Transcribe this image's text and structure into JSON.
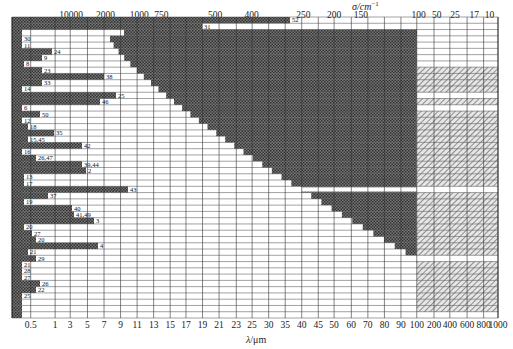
{
  "chart_data": {
    "type": "bar",
    "subtype": "horizontal-range-bars (infrared transmission ranges of materials)",
    "title": "",
    "top_axis": {
      "label": "σ/cm⁻¹",
      "ticks": [
        "10000",
        "2000",
        "1000",
        "750",
        "500",
        "400",
        "250",
        "200",
        "150",
        "100",
        "50",
        "25",
        "17",
        "10"
      ]
    },
    "bottom_axis": {
      "label": "λ/μm",
      "ticks": [
        "0.5",
        "1",
        "3",
        "5",
        "7",
        "9",
        "11",
        "13",
        "15",
        "17",
        "19",
        "21",
        "23",
        "25",
        "30",
        "35",
        "40",
        "45",
        "50",
        "60",
        "70",
        "80",
        "90",
        "100",
        "200",
        "400",
        "600",
        "800",
        "1000"
      ]
    },
    "grid": true,
    "legend": "none",
    "series": [
      {
        "label": "52",
        "start": 0.5,
        "end": "~33 μm (col 17.3)"
      },
      {
        "label": "31",
        "start": 0.5,
        "end": "~19 μm (col 9)"
      },
      {
        "label": "",
        "start": 0.5,
        "end": "~1.5 μm"
      },
      {
        "label": "30",
        "start": 0.5,
        "end": "~0.7 μm"
      },
      {
        "label": "11",
        "start": 0.5,
        "end": "~0.55 μm"
      },
      {
        "label": "24",
        "start": 0.5,
        "end": "~1 μm"
      },
      {
        "label": "9",
        "start": 0.5,
        "end": "~2 μm"
      },
      {
        "label": "8",
        "start": 0.5,
        "end": "~1.2 μm"
      },
      {
        "label": "23",
        "start": 0.5,
        "end": "~1 μm"
      },
      {
        "label": "38",
        "start": 0.5,
        "end": "~9 μm"
      },
      {
        "label": "33",
        "start": 0.5,
        "end": "~1.5 μm"
      },
      {
        "label": "14",
        "start": 0.5,
        "end": "~0.6 μm"
      },
      {
        "label": "25",
        "start": 0.5,
        "end": "~9 μm"
      },
      {
        "label": "46",
        "start": 0.5,
        "end": "~6 μm"
      },
      {
        "label": "6",
        "start": 0.5,
        "end": "~0.6 μm"
      },
      {
        "label": "50",
        "start": 0.5,
        "end": "~1 μm"
      },
      {
        "label": "12",
        "start": 0.5,
        "end": "~0.6 μm"
      },
      {
        "label": "18",
        "start": 0.5,
        "end": "~0.8 μm"
      },
      {
        "label": "35",
        "start": 0.5,
        "end": "~1.6 μm"
      },
      {
        "label": "15,45",
        "start": 0.5,
        "end": "~0.7 μm"
      },
      {
        "label": "42",
        "start": 0.5,
        "end": "~6 μm"
      },
      {
        "label": "16",
        "start": 0.5,
        "end": "~0.7 μm"
      },
      {
        "label": "26,47",
        "start": 0.5,
        "end": "~1 μm"
      },
      {
        "label": "39,44",
        "start": 0.5,
        "end": "~6 μm"
      },
      {
        "label": "2",
        "start": 0.5,
        "end": "~6.5 μm"
      },
      {
        "label": "13",
        "start": 0.5,
        "end": "~0.7 μm"
      },
      {
        "label": "17",
        "start": 0.5,
        "end": "~0.7 μm"
      },
      {
        "label": "43",
        "start": 0.5,
        "end": "~9 μm"
      },
      {
        "label": "37",
        "start": 0.5,
        "end": "~1.5 μm"
      },
      {
        "label": "19",
        "start": 0.5,
        "end": "~0.8 μm"
      },
      {
        "label": "40",
        "start": 0.5,
        "end": "~3 μm"
      },
      {
        "label": "41,49",
        "start": 0.5,
        "end": "~3 μm"
      },
      {
        "label": "3",
        "start": 0.5,
        "end": "~6 μm"
      },
      {
        "label": "20",
        "start": 0.5,
        "end": "~0.7 μm"
      },
      {
        "label": "27",
        "start": 0.5,
        "end": "~0.9 μm"
      },
      {
        "label": "20",
        "start": 0.5,
        "end": "~0.9 μm"
      },
      {
        "label": "4",
        "start": 0.5,
        "end": "~6 μm"
      },
      {
        "label": "21",
        "start": 0.5,
        "end": "~0.7 μm"
      },
      {
        "label": "29",
        "start": 0.5,
        "end": "~1 μm"
      },
      {
        "label": "21",
        "start": 0.5,
        "end": "~0.6 μm"
      },
      {
        "label": "28",
        "start": 0.5,
        "end": "~0.6 μm"
      },
      {
        "label": "27",
        "start": 0.5,
        "end": "~0.6 μm"
      },
      {
        "label": "26",
        "start": 0.5,
        "end": "~1 μm"
      },
      {
        "label": "22",
        "start": 0.5,
        "end": "~0.8 μm"
      },
      {
        "label": "25",
        "start": 0.5,
        "end": "~0.6 μm"
      }
    ]
  },
  "axes": {
    "top_title": "σ/cm",
    "top_title_sup": "−1",
    "bottom_title_sym": "λ",
    "bottom_title_unit": "/μm"
  },
  "colors": {
    "dark_fill": "#5a5a5a",
    "light_hatch": "#9a9a9a",
    "grid": "#333333",
    "background": "#ffffff"
  }
}
